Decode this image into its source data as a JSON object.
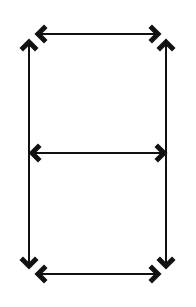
{
  "diagram": {
    "stroke_color": "#111111",
    "background": "#ffffff",
    "arrows": [
      {
        "id": "top",
        "x1": 38,
        "y1": 34,
        "x2": 158,
        "y2": 34,
        "heads": "both"
      },
      {
        "id": "middle",
        "x1": 32,
        "y1": 153,
        "x2": 164,
        "y2": 153,
        "heads": "both"
      },
      {
        "id": "bottom",
        "x1": 38,
        "y1": 274,
        "x2": 158,
        "y2": 274,
        "heads": "both"
      },
      {
        "id": "left",
        "x1": 29,
        "y1": 42,
        "x2": 29,
        "y2": 266,
        "heads": "both"
      },
      {
        "id": "right",
        "x1": 166,
        "y1": 42,
        "x2": 166,
        "y2": 266,
        "heads": "both"
      }
    ]
  }
}
